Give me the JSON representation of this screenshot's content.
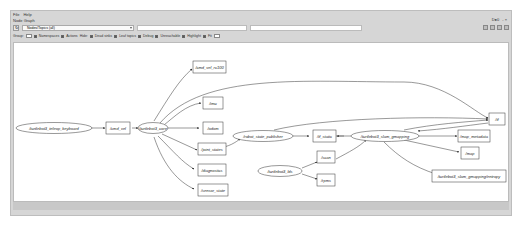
{
  "window": {
    "menu": [
      "File",
      "Help"
    ],
    "panel_title": "Node Graph",
    "header_right": [
      "D●0",
      "- ×"
    ]
  },
  "toolbar": {
    "graph_type": "Nodes/Topics (all)",
    "node_filter_placeholder": "",
    "topic_filter_placeholder": "",
    "icons": [
      "refresh-icon",
      "save-dot-icon",
      "save-svg-icon",
      "load-icon",
      "fit-icon"
    ]
  },
  "options": {
    "group_label": "Group:",
    "group_value": "2",
    "namespaces": "Namespaces",
    "actions": "Actions",
    "hide_label": "Hide:",
    "dead_sinks": "Dead sinks",
    "leaf_topics": "Leaf topics",
    "debug": "Debug",
    "tf": "tf",
    "unreachable": "Unreachable",
    "highlight": "Highlight",
    "fit": "Fit"
  },
  "graph": {
    "nodes": [
      {
        "id": "teleop",
        "label": "/turtlebot3_teleop_keyboard",
        "shape": "ellipse"
      },
      {
        "id": "core",
        "label": "/turtlebot3_core",
        "shape": "ellipse"
      },
      {
        "id": "rsp",
        "label": "/robot_state_publisher",
        "shape": "ellipse"
      },
      {
        "id": "slam",
        "label": "/turtlebot3_slam_gmapping",
        "shape": "ellipse"
      },
      {
        "id": "lds",
        "label": "/turtlebot3_lds",
        "shape": "ellipse"
      }
    ],
    "topics": [
      {
        "id": "cmd_vel",
        "label": "/cmd_vel"
      },
      {
        "id": "cmd_vel_rc100",
        "label": "/cmd_vel_rc100"
      },
      {
        "id": "imu",
        "label": "/imu"
      },
      {
        "id": "odom",
        "label": "/odom"
      },
      {
        "id": "joint_states",
        "label": "/joint_states"
      },
      {
        "id": "diagnostics",
        "label": "/diagnostics"
      },
      {
        "id": "sensor_state",
        "label": "/sensor_state"
      },
      {
        "id": "tf_static",
        "label": "/tf_static"
      },
      {
        "id": "scan",
        "label": "/scan"
      },
      {
        "id": "rpms",
        "label": "/rpms"
      },
      {
        "id": "tf",
        "label": "/tf"
      },
      {
        "id": "map_metadata",
        "label": "/map_metadata"
      },
      {
        "id": "map",
        "label": "/map"
      },
      {
        "id": "entropy",
        "label": "/turtlebot3_slam_gmapping/entropy"
      }
    ]
  }
}
